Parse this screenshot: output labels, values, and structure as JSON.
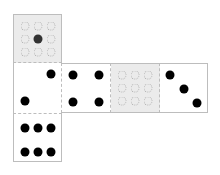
{
  "diagram": {
    "cell_size": 49,
    "faces": [
      {
        "id": "top",
        "col": 0,
        "row": 0,
        "pips": 1,
        "style": "grid-hint",
        "marked_cell": 4
      },
      {
        "id": "left",
        "col": 0,
        "row": 1,
        "pips": 2
      },
      {
        "id": "front",
        "col": 1,
        "row": 1,
        "pips": 4
      },
      {
        "id": "right",
        "col": 2,
        "row": 1,
        "pips": 0,
        "style": "grid-hint"
      },
      {
        "id": "back",
        "col": 3,
        "row": 1,
        "pips": 3
      },
      {
        "id": "bottom",
        "col": 0,
        "row": 2,
        "pips": 6
      }
    ],
    "colors": {
      "pip": "#000000",
      "blank_face": "#ebebeb",
      "edge": "#bdbdbd"
    }
  }
}
